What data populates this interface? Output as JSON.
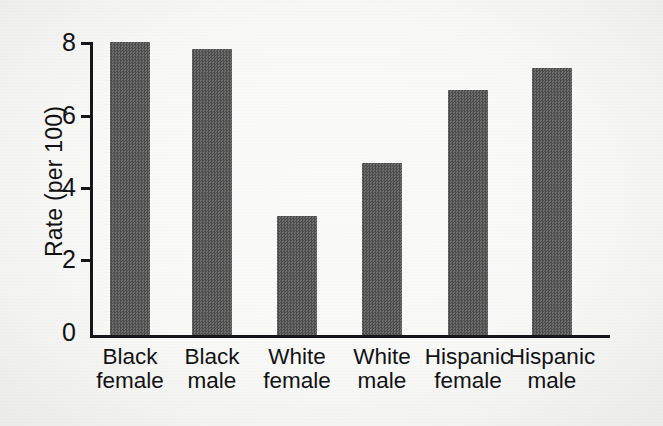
{
  "chart_data": {
    "type": "bar",
    "title": "",
    "xlabel": "",
    "ylabel": "Rate (per 100)",
    "categories": [
      "Black female",
      "Black male",
      "White female",
      "White male",
      "Hispanic female",
      "Hispanic male"
    ],
    "category_lines": [
      [
        "Black",
        "female"
      ],
      [
        "Black",
        "male"
      ],
      [
        "White",
        "female"
      ],
      [
        "White",
        "male"
      ],
      [
        "Hispanic",
        "female"
      ],
      [
        "Hispanic",
        "male"
      ]
    ],
    "values": [
      8.0,
      7.8,
      3.25,
      4.7,
      6.7,
      7.3
    ],
    "ylim": [
      0,
      8
    ],
    "yticks": [
      0,
      2,
      4,
      6,
      8
    ],
    "ytick_labels": [
      "0",
      "2",
      "4",
      "6",
      "8"
    ],
    "grid": false,
    "legend": false,
    "bar_color": "#5a5a5a",
    "axis_color": "#16161a",
    "background_color": "#f1f1ef"
  },
  "axis": {
    "y_title": "Rate (per 100)",
    "ticks": [
      {
        "label": "8",
        "value": 8
      },
      {
        "label": "6",
        "value": 6
      },
      {
        "label": "4",
        "value": 4
      },
      {
        "label": "2",
        "value": 2
      },
      {
        "label": "0",
        "value": 0
      }
    ]
  },
  "bars": [
    {
      "line1": "Black",
      "line2": "female",
      "value": 8.0
    },
    {
      "line1": "Black",
      "line2": "male",
      "value": 7.8
    },
    {
      "line1": "White",
      "line2": "female",
      "value": 3.25
    },
    {
      "line1": "White",
      "line2": "male",
      "value": 4.7
    },
    {
      "line1": "Hispanic",
      "line2": "female",
      "value": 6.7
    },
    {
      "line1": "Hispanic",
      "line2": "male",
      "value": 7.3
    }
  ]
}
